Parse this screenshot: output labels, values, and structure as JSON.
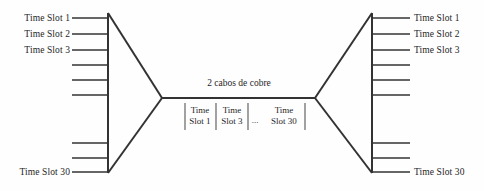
{
  "diagram": {
    "type": "tdm-multiplexing-diagram",
    "background_color": "#fefefe",
    "line_color": "#333333",
    "text_color": "#1f1f1f",
    "cable_label": "2 cabos de cobre",
    "left_inputs": {
      "labeled": [
        {
          "index": 1,
          "label": "Time Slot 1",
          "y": 18
        },
        {
          "index": 2,
          "label": "Time Slot 2",
          "y": 34
        },
        {
          "index": 3,
          "label": "Time Slot 3",
          "y": 50
        },
        {
          "index": 30,
          "label": "Time Slot 30",
          "y": 172
        }
      ],
      "unlabeled_tick_count": 5
    },
    "right_outputs": {
      "labeled": [
        {
          "index": 1,
          "label": "Time Slot 1",
          "y": 18
        },
        {
          "index": 2,
          "label": "Time Slot 2",
          "y": 34
        },
        {
          "index": 3,
          "label": "Time Slot 3",
          "y": 50
        },
        {
          "index": 30,
          "label": "Time Slot 30",
          "y": 172
        }
      ],
      "unlabeled_tick_count": 5
    },
    "frame_cells": [
      {
        "line1": "Time",
        "line2": "Slot 1"
      },
      {
        "line1": "Time",
        "line2": "Slot 3"
      },
      {
        "line1": "Time",
        "line2": "Slot 30"
      }
    ],
    "frame_ellipsis": "..."
  }
}
